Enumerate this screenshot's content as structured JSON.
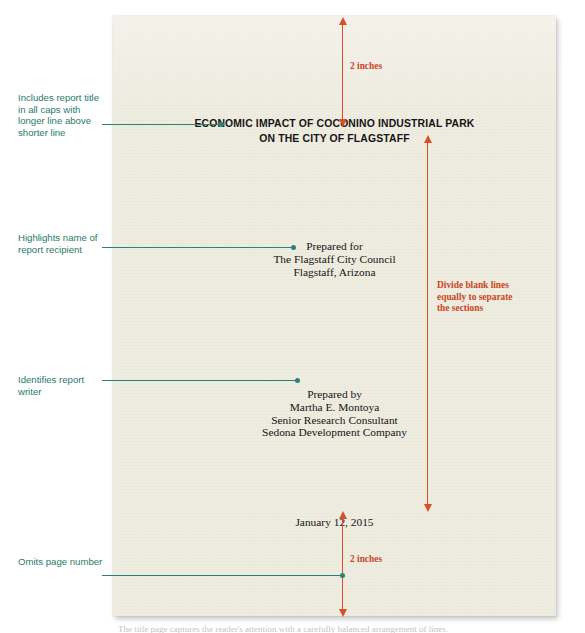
{
  "figure": {
    "credit": "© Cengage Learning 2015",
    "bottom_caption": "The title page captures the reader's attention with a carefully balanced arrangement of lines.",
    "page_background_color": "#efece0",
    "accent_red": "#d8502a",
    "accent_teal": "#2a8274"
  },
  "document": {
    "title_line_1": "ECONOMIC IMPACT OF COCONINO INDUSTRIAL PARK",
    "title_line_2": "ON THE CITY OF FLAGSTAFF",
    "recipient": {
      "heading": "Prepared for",
      "line_1": "The Flagstaff City Council",
      "line_2": "Flagstaff, Arizona"
    },
    "writer": {
      "heading": "Prepared by",
      "line_1": "Martha E. Montoya",
      "line_2": "Senior Research Consultant",
      "line_3": "Sedona Development Company"
    },
    "date": "January 12, 2015"
  },
  "measurements": {
    "top_margin_label": "2 inches",
    "bottom_margin_label": "2 inches",
    "divide_label": "Divide blank lines equally to separate the sections"
  },
  "callouts": {
    "title": "Includes report title in all caps with longer line above shorter line",
    "recipient": "Highlights name of report recipient",
    "writer": "Identifies report writer",
    "page_number": "Omits page number"
  }
}
